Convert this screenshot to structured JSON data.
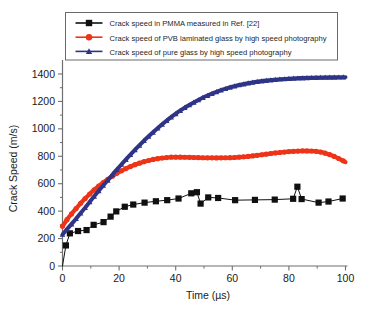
{
  "chart_data": {
    "type": "line",
    "title": "",
    "xlabel": "Time (µs)",
    "ylabel": "Crack Speed (m/s)",
    "xlim": [
      0,
      100
    ],
    "ylim": [
      0,
      1480
    ],
    "xticks": [
      0,
      20,
      40,
      60,
      80,
      100
    ],
    "yticks": [
      0,
      200,
      400,
      600,
      800,
      1000,
      1200,
      1400
    ],
    "xtick_labels": [
      "0",
      "20",
      "40",
      "60",
      "80",
      "100"
    ],
    "ytick_labels": [
      "0",
      "200",
      "400",
      "600",
      "800",
      "1000",
      "1200",
      "1400"
    ],
    "xminor_step": 10,
    "yminor_step": 100,
    "grid": false,
    "legend_position": "top-center",
    "series": [
      {
        "name": "Crack speed in PMMA measured in Ref. [22]",
        "color": "#101010",
        "marker": "square",
        "marker_size": 3.1,
        "line_width": 1.0,
        "points": [
          [
            0,
            0
          ],
          [
            1.2,
            150
          ],
          [
            2.6,
            238
          ],
          [
            5.5,
            255
          ],
          [
            8.5,
            262
          ],
          [
            11.0,
            300
          ],
          [
            14.5,
            320
          ],
          [
            17.0,
            360
          ],
          [
            19.0,
            398
          ],
          [
            22.0,
            432
          ],
          [
            25.0,
            448
          ],
          [
            29.0,
            462
          ],
          [
            33.0,
            472
          ],
          [
            37.0,
            480
          ],
          [
            41.0,
            492
          ],
          [
            45.5,
            530
          ],
          [
            47.5,
            538
          ],
          [
            48.8,
            455
          ],
          [
            51.5,
            500
          ],
          [
            55.0,
            496
          ],
          [
            61.0,
            480
          ],
          [
            68.0,
            482
          ],
          [
            75.0,
            484
          ],
          [
            81.5,
            490
          ],
          [
            83.0,
            578
          ],
          [
            84.5,
            488
          ],
          [
            90.5,
            462
          ],
          [
            94.0,
            470
          ],
          [
            99.0,
            492
          ]
        ]
      },
      {
        "name": "Crack speed of PVB laminated glass by high speed photography",
        "color": "#EE3418",
        "marker": "circle",
        "marker_size": 2.6,
        "line_width": 4.2,
        "points": [
          [
            0,
            290
          ],
          [
            2,
            350
          ],
          [
            4,
            400
          ],
          [
            6,
            448
          ],
          [
            8,
            492
          ],
          [
            10,
            533
          ],
          [
            12,
            570
          ],
          [
            14,
            603
          ],
          [
            16,
            632
          ],
          [
            18,
            660
          ],
          [
            20,
            686
          ],
          [
            23,
            716
          ],
          [
            26,
            742
          ],
          [
            29,
            762
          ],
          [
            32,
            777
          ],
          [
            35,
            787
          ],
          [
            38,
            793
          ],
          [
            41,
            794
          ],
          [
            45,
            792
          ],
          [
            50,
            789
          ],
          [
            55,
            788
          ],
          [
            60,
            790
          ],
          [
            65,
            797
          ],
          [
            70,
            810
          ],
          [
            75,
            824
          ],
          [
            80,
            834
          ],
          [
            85,
            840
          ],
          [
            89,
            838
          ],
          [
            92,
            828
          ],
          [
            95,
            808
          ],
          [
            97.5,
            785
          ],
          [
            100,
            758
          ]
        ]
      },
      {
        "name": "Crack speed of pure glass by high speed photography",
        "color": "#2F3487",
        "marker": "triangle",
        "marker_size": 2.8,
        "line_width": 4.0,
        "points": [
          [
            0,
            230
          ],
          [
            2,
            278
          ],
          [
            4,
            325
          ],
          [
            6,
            375
          ],
          [
            8,
            425
          ],
          [
            10,
            478
          ],
          [
            12,
            528
          ],
          [
            14,
            578
          ],
          [
            16,
            625
          ],
          [
            18,
            675
          ],
          [
            20,
            722
          ],
          [
            23,
            790
          ],
          [
            26,
            855
          ],
          [
            29,
            918
          ],
          [
            32,
            975
          ],
          [
            35,
            1030
          ],
          [
            38,
            1080
          ],
          [
            41,
            1125
          ],
          [
            44,
            1165
          ],
          [
            47,
            1200
          ],
          [
            50,
            1232
          ],
          [
            53,
            1258
          ],
          [
            56,
            1282
          ],
          [
            59,
            1302
          ],
          [
            62,
            1318
          ],
          [
            65,
            1331
          ],
          [
            68,
            1342
          ],
          [
            71,
            1350
          ],
          [
            74,
            1357
          ],
          [
            77,
            1362
          ],
          [
            80,
            1366
          ],
          [
            84,
            1370
          ],
          [
            88,
            1373
          ],
          [
            92,
            1375
          ],
          [
            96,
            1376
          ],
          [
            100,
            1377
          ]
        ]
      }
    ]
  },
  "legend": {
    "entries": [
      {
        "label": "Crack speed in PMMA measured in Ref. [22]",
        "color": "#101010",
        "marker": "square"
      },
      {
        "label": "Crack speed of PVB laminated glass by high speed photography",
        "color": "#EE3418",
        "marker": "circle"
      },
      {
        "label": "Crack speed of pure glass by high speed photography",
        "color": "#2F3487",
        "marker": "triangle"
      }
    ]
  },
  "colors": {
    "background": "#ffffff",
    "axis": "#6f6f6f",
    "text": "#1a1a1a",
    "pmma": "#101010",
    "pvb": "#EE3418",
    "pure_glass": "#2F3487"
  }
}
